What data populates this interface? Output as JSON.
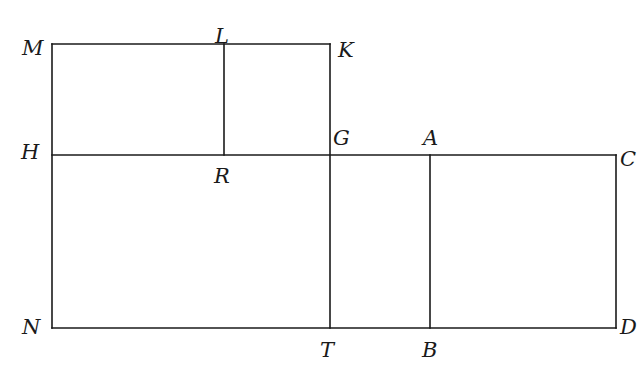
{
  "figure": {
    "type": "geometry-diagram",
    "stroke_color": "#1a1a1a",
    "background_color": "#ffffff",
    "stroke_width": 1.6,
    "vertices": [
      {
        "id": "M",
        "label": "M",
        "x": 52,
        "y": 44,
        "label_x": 22,
        "label_y": 38
      },
      {
        "id": "L",
        "label": "L",
        "x": 224,
        "y": 44,
        "label_x": 215,
        "label_y": 26
      },
      {
        "id": "K",
        "label": "K",
        "x": 330,
        "y": 44,
        "label_x": 338,
        "label_y": 40
      },
      {
        "id": "H",
        "label": "H",
        "x": 52,
        "y": 155,
        "label_x": 21,
        "label_y": 142
      },
      {
        "id": "R",
        "label": "R",
        "x": 224,
        "y": 155,
        "label_x": 214,
        "label_y": 166
      },
      {
        "id": "G",
        "label": "G",
        "x": 330,
        "y": 155,
        "label_x": 333,
        "label_y": 128
      },
      {
        "id": "A",
        "label": "A",
        "x": 430,
        "y": 155,
        "label_x": 423,
        "label_y": 128
      },
      {
        "id": "C",
        "label": "C",
        "x": 616,
        "y": 155,
        "label_x": 620,
        "label_y": 149
      },
      {
        "id": "N",
        "label": "N",
        "x": 52,
        "y": 328,
        "label_x": 22,
        "label_y": 317
      },
      {
        "id": "T",
        "label": "T",
        "x": 330,
        "y": 328,
        "label_x": 320,
        "label_y": 340
      },
      {
        "id": "B",
        "label": "B",
        "x": 430,
        "y": 328,
        "label_x": 422,
        "label_y": 340
      },
      {
        "id": "D",
        "label": "D",
        "x": 616,
        "y": 328,
        "label_x": 620,
        "label_y": 317
      }
    ],
    "segments": [
      {
        "name": "segment-M-K",
        "x1": 52,
        "y1": 44,
        "x2": 330,
        "y2": 44
      },
      {
        "name": "segment-M-N",
        "x1": 52,
        "y1": 44,
        "x2": 52,
        "y2": 328
      },
      {
        "name": "segment-N-D",
        "x1": 52,
        "y1": 328,
        "x2": 616,
        "y2": 328
      },
      {
        "name": "segment-H-C",
        "x1": 52,
        "y1": 155,
        "x2": 616,
        "y2": 155
      },
      {
        "name": "segment-K-T",
        "x1": 330,
        "y1": 44,
        "x2": 330,
        "y2": 328
      },
      {
        "name": "segment-L-R",
        "x1": 224,
        "y1": 44,
        "x2": 224,
        "y2": 155
      },
      {
        "name": "segment-A-B",
        "x1": 430,
        "y1": 155,
        "x2": 430,
        "y2": 328
      },
      {
        "name": "segment-C-D",
        "x1": 616,
        "y1": 155,
        "x2": 616,
        "y2": 328
      }
    ]
  }
}
